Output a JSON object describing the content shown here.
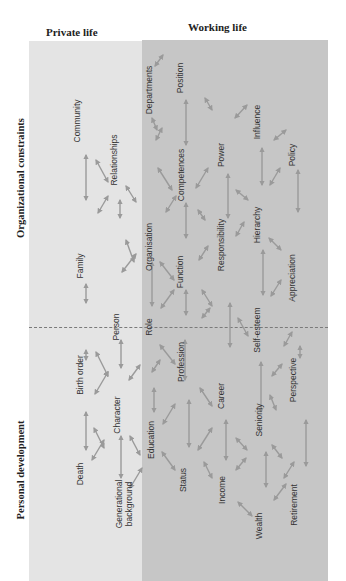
{
  "columns": {
    "private": "Private life",
    "working": "Working life"
  },
  "axes": {
    "top": "Organizational constraints",
    "bottom": "Personal development"
  },
  "colors": {
    "private_bg": "#e4e4e4",
    "working_bg": "#c6c6c6",
    "arrow": "#9a9a9a",
    "divider": "#7a7a7a"
  },
  "nodes": [
    {
      "id": "community",
      "label": "Community",
      "x": 77,
      "y": 121
    },
    {
      "id": "relationships",
      "label": "Relationships",
      "x": 114,
      "y": 160
    },
    {
      "id": "family",
      "label": "Family",
      "x": 80,
      "y": 266
    },
    {
      "id": "person",
      "label": "Person",
      "x": 116,
      "y": 327
    },
    {
      "id": "birth_order",
      "label": "Birth order",
      "x": 80,
      "y": 375
    },
    {
      "id": "character",
      "label": "Character",
      "x": 117,
      "y": 415
    },
    {
      "id": "death",
      "label": "Death",
      "x": 80,
      "y": 474
    },
    {
      "id": "generational_background",
      "label": "Generational background",
      "x": 124,
      "y": 504
    },
    {
      "id": "departments",
      "label": "Departments",
      "x": 149,
      "y": 90
    },
    {
      "id": "position",
      "label": "Position",
      "x": 180,
      "y": 78
    },
    {
      "id": "competences",
      "label": "Competences",
      "x": 181,
      "y": 175
    },
    {
      "id": "power",
      "label": "Power",
      "x": 221,
      "y": 155
    },
    {
      "id": "influence",
      "label": "Influence",
      "x": 257,
      "y": 122
    },
    {
      "id": "policy",
      "label": "Policy",
      "x": 292,
      "y": 155
    },
    {
      "id": "organisation",
      "label": "Organisation",
      "x": 149,
      "y": 247
    },
    {
      "id": "function",
      "label": "Function",
      "x": 180,
      "y": 272
    },
    {
      "id": "responsibility",
      "label": "Responsibility",
      "x": 221,
      "y": 245
    },
    {
      "id": "hierarchy",
      "label": "Hierarchy",
      "x": 257,
      "y": 225
    },
    {
      "id": "appreciation",
      "label": "Appreciation",
      "x": 292,
      "y": 278
    },
    {
      "id": "role",
      "label": "Role",
      "x": 149,
      "y": 327
    },
    {
      "id": "self_esteem",
      "label": "Self-esteem",
      "x": 257,
      "y": 330
    },
    {
      "id": "profession",
      "label": "Profession",
      "x": 181,
      "y": 362
    },
    {
      "id": "career",
      "label": "Career",
      "x": 221,
      "y": 396
    },
    {
      "id": "perspective",
      "label": "Perspective",
      "x": 293,
      "y": 380
    },
    {
      "id": "seniority",
      "label": "Seniority",
      "x": 259,
      "y": 420
    },
    {
      "id": "education",
      "label": "Education",
      "x": 151,
      "y": 440
    },
    {
      "id": "status",
      "label": "Status",
      "x": 183,
      "y": 480
    },
    {
      "id": "income",
      "label": "Income",
      "x": 222,
      "y": 490
    },
    {
      "id": "retirement",
      "label": "Retirement",
      "x": 294,
      "y": 505
    },
    {
      "id": "wealth",
      "label": "Wealth",
      "x": 259,
      "y": 526
    }
  ],
  "links": [
    [
      86,
      155,
      86,
      200
    ],
    [
      96,
      160,
      108,
      182
    ],
    [
      98,
      213,
      108,
      196
    ],
    [
      120,
      200,
      120,
      218
    ],
    [
      126,
      186,
      136,
      202
    ],
    [
      86,
      284,
      86,
      303
    ],
    [
      126,
      240,
      134,
      262
    ],
    [
      122,
      272,
      136,
      254
    ],
    [
      86,
      350,
      86,
      360
    ],
    [
      96,
      352,
      108,
      376
    ],
    [
      95,
      394,
      108,
      372
    ],
    [
      121,
      340,
      121,
      368
    ],
    [
      129,
      380,
      140,
      365
    ],
    [
      86,
      412,
      86,
      450
    ],
    [
      94,
      428,
      104,
      448
    ],
    [
      92,
      460,
      104,
      440
    ],
    [
      121,
      436,
      121,
      478
    ],
    [
      130,
      436,
      140,
      455
    ],
    [
      130,
      488,
      142,
      468
    ],
    [
      155,
      66,
      163,
      55
    ],
    [
      186,
      100,
      186,
      145
    ],
    [
      152,
      118,
      157,
      130
    ],
    [
      156,
      140,
      162,
      128
    ],
    [
      158,
      168,
      172,
      190
    ],
    [
      166,
      212,
      176,
      196
    ],
    [
      186,
      203,
      186,
      238
    ],
    [
      205,
      98,
      212,
      110
    ],
    [
      196,
      188,
      208,
      168
    ],
    [
      152,
      262,
      152,
      306
    ],
    [
      160,
      262,
      174,
      280
    ],
    [
      161,
      308,
      174,
      290
    ],
    [
      186,
      290,
      186,
      315
    ],
    [
      198,
      210,
      205,
      220
    ],
    [
      199,
      260,
      208,
      246
    ],
    [
      228,
      174,
      228,
      218
    ],
    [
      236,
      190,
      248,
      200
    ],
    [
      236,
      236,
      244,
      222
    ],
    [
      235,
      118,
      247,
      105
    ],
    [
      262,
      148,
      262,
      185
    ],
    [
      274,
      140,
      286,
      130
    ],
    [
      270,
      185,
      280,
      168
    ],
    [
      298,
      170,
      298,
      212
    ],
    [
      269,
      238,
      281,
      250
    ],
    [
      263,
      250,
      263,
      295
    ],
    [
      271,
      296,
      281,
      280
    ],
    [
      202,
      290,
      212,
      306
    ],
    [
      210,
      308,
      202,
      318
    ],
    [
      230,
      303,
      230,
      347
    ],
    [
      238,
      318,
      248,
      336
    ],
    [
      160,
      345,
      175,
      364
    ],
    [
      185,
      340,
      185,
      380
    ],
    [
      160,
      360,
      152,
      372
    ],
    [
      284,
      346,
      292,
      332
    ],
    [
      300,
      346,
      300,
      358
    ],
    [
      261,
      362,
      261,
      412
    ],
    [
      272,
      376,
      282,
      364
    ],
    [
      270,
      395,
      276,
      410
    ],
    [
      154,
      388,
      154,
      412
    ],
    [
      163,
      424,
      175,
      404
    ],
    [
      162,
      452,
      175,
      470
    ],
    [
      189,
      400,
      189,
      447
    ],
    [
      200,
      388,
      212,
      406
    ],
    [
      198,
      450,
      212,
      428
    ],
    [
      226,
      420,
      226,
      460
    ],
    [
      236,
      438,
      247,
      450
    ],
    [
      236,
      470,
      246,
      458
    ],
    [
      306,
      420,
      306,
      466
    ],
    [
      272,
      445,
      282,
      458
    ],
    [
      266,
      452,
      266,
      487
    ],
    [
      274,
      500,
      286,
      484
    ],
    [
      204,
      462,
      212,
      478
    ],
    [
      238,
      502,
      252,
      516
    ],
    [
      284,
      478,
      294,
      462
    ]
  ]
}
